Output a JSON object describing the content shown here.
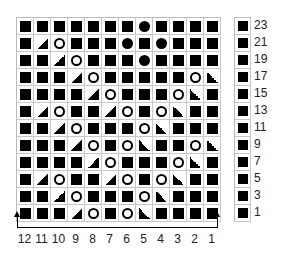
{
  "chart": {
    "columns": 12,
    "rows": 12,
    "grid": [
      [
        "k",
        "k",
        "k",
        "k",
        "k",
        "k",
        "k",
        "loz",
        "k",
        "k",
        "k",
        "k"
      ],
      [
        "k",
        "k2tog",
        "yo",
        "k",
        "k",
        "k",
        "loz",
        "k",
        "loz",
        "k",
        "k",
        "k"
      ],
      [
        "k",
        "k",
        "k2tog",
        "yo",
        "k",
        "k",
        "k",
        "loz",
        "k",
        "k",
        "k",
        "k"
      ],
      [
        "k",
        "k",
        "k",
        "k2tog",
        "yo",
        "k",
        "k",
        "k",
        "k",
        "k",
        "yo",
        "ssk"
      ],
      [
        "k",
        "k",
        "k",
        "k",
        "k2tog",
        "yo",
        "k",
        "k",
        "k",
        "yo",
        "ssk",
        "k"
      ],
      [
        "k",
        "k2tog",
        "yo",
        "k",
        "k",
        "k2tog",
        "yo",
        "k",
        "yo",
        "ssk",
        "k",
        "k"
      ],
      [
        "k",
        "k",
        "k2tog",
        "yo",
        "k",
        "k",
        "k",
        "yo",
        "ssk",
        "k",
        "k",
        "k"
      ],
      [
        "k",
        "k",
        "k",
        "k2tog",
        "yo",
        "k",
        "yo",
        "ssk",
        "k",
        "k",
        "yo",
        "ssk"
      ],
      [
        "k",
        "k",
        "k",
        "k",
        "k2tog",
        "yo",
        "k",
        "k",
        "k",
        "yo",
        "ssk",
        "k"
      ],
      [
        "k",
        "k2tog",
        "yo",
        "k",
        "k",
        "k2tog",
        "yo",
        "k",
        "yo",
        "ssk",
        "k",
        "k"
      ],
      [
        "k",
        "k",
        "k2tog",
        "yo",
        "k",
        "k",
        "k",
        "yo",
        "ssk",
        "k",
        "k",
        "k"
      ],
      [
        "k",
        "k",
        "k",
        "k2tog",
        "yo",
        "k",
        "yo",
        "ssk",
        "k",
        "k",
        "k",
        "k"
      ]
    ],
    "row_labels": [
      "23",
      "21",
      "19",
      "17",
      "15",
      "13",
      "11",
      "9",
      "7",
      "5",
      "3",
      "1"
    ],
    "column_labels": [
      "12",
      "11",
      "10",
      "9",
      "8",
      "7",
      "6",
      "5",
      "4",
      "3",
      "2",
      "1"
    ],
    "symbol_legend": {
      "k": "filled-square",
      "yo": "open-circle",
      "k2tog": "triangle-left",
      "ssk": "triangle-right",
      "loz": "lozenge"
    }
  }
}
